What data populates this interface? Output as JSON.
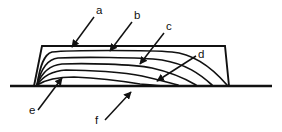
{
  "figure": {
    "background_color": "#ffffff",
    "line_color": "#111111",
    "width": 282,
    "height": 132
  },
  "labels": [
    {
      "id": "a",
      "text": "a",
      "x": 96,
      "y": 14,
      "points_to": "top-surface-of-section"
    },
    {
      "id": "b",
      "text": "b",
      "x": 134,
      "y": 19,
      "points_to": "first-inner-flow-line"
    },
    {
      "id": "c",
      "text": "c",
      "x": 166,
      "y": 30,
      "points_to": "second-inner-flow-line"
    },
    {
      "id": "d",
      "text": "d",
      "x": 198,
      "y": 58,
      "points_to": "lower-right-flow-line"
    },
    {
      "id": "e",
      "text": "e",
      "x": 29,
      "y": 114,
      "points_to": "left-toe-convergence"
    },
    {
      "id": "f",
      "text": "f",
      "x": 95,
      "y": 124,
      "points_to": "base-line"
    }
  ],
  "leaders": [
    {
      "id": "leader-a",
      "from_x": 94,
      "from_y": 17,
      "to_x": 72,
      "to_y": 47
    },
    {
      "id": "leader-b",
      "from_x": 132,
      "from_y": 22,
      "to_x": 110,
      "to_y": 51
    },
    {
      "id": "leader-c",
      "from_x": 164,
      "from_y": 33,
      "to_x": 140,
      "to_y": 64
    },
    {
      "id": "leader-d",
      "from_x": 196,
      "from_y": 56,
      "to_x": 157,
      "to_y": 81
    },
    {
      "id": "leader-e",
      "from_x": 38,
      "from_y": 110,
      "to_x": 62,
      "to_y": 78
    },
    {
      "id": "leader-f",
      "from_x": 105,
      "from_y": 120,
      "to_x": 131,
      "to_y": 92
    }
  ],
  "geometry": {
    "baseline": {
      "x1": 10,
      "y1": 86,
      "x2": 272,
      "y2": 86
    },
    "section_outline": "M 34 86 L 42 46 L 225 46 L 229 86",
    "flow_lines": [
      "M 37 85 C 40 66, 44 54, 52 52 C 70 50, 150 50, 172 52 C 196 54, 214 70, 227 85",
      "M 37 85 C 41 69, 47 59, 58 58 C 78 57, 140 57, 162 60 C 186 64, 200 74, 212 85",
      "M 37 85 C 42 72, 50 65, 62 64 C 84 63, 132 64, 152 68 C 174 73, 186 79, 196 85",
      "M 37 85 C 43 76, 52 71, 66 70 C 88 70, 124 72, 142 76 C 160 80, 170 83, 178 85",
      "M 37 85 C 45 80, 58 77, 74 77 C 96 78, 122 81, 140 84 C 150 85, 158 86, 163 86"
    ]
  }
}
